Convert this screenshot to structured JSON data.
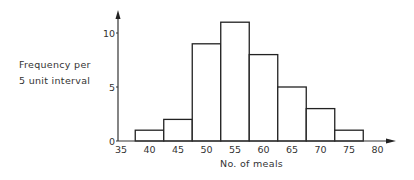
{
  "chart_data": {
    "type": "bar",
    "subtype": "histogram",
    "title": "",
    "xlabel": "No. of meals",
    "ylabel": [
      "Frequency per",
      "5 unit interval"
    ],
    "bin_edges": [
      37.5,
      42.5,
      47.5,
      52.5,
      57.5,
      62.5,
      67.5,
      72.5,
      77.5
    ],
    "categories": [
      "37.5-42.5",
      "42.5-47.5",
      "47.5-52.5",
      "52.5-57.5",
      "57.5-62.5",
      "62.5-67.5",
      "67.5-72.5",
      "72.5-77.5"
    ],
    "bin_centers": [
      40,
      45,
      50,
      55,
      60,
      65,
      70,
      75
    ],
    "values": [
      1,
      2,
      9,
      11,
      8,
      5,
      3,
      1
    ],
    "x_ticks": [
      "35",
      "40",
      "45",
      "50",
      "55",
      "60",
      "65",
      "70",
      "75",
      "80"
    ],
    "y_ticks": [
      "0",
      "5",
      "10"
    ],
    "xlim": [
      35,
      82
    ],
    "ylim": [
      0,
      12
    ],
    "grid": false,
    "legend": null
  }
}
